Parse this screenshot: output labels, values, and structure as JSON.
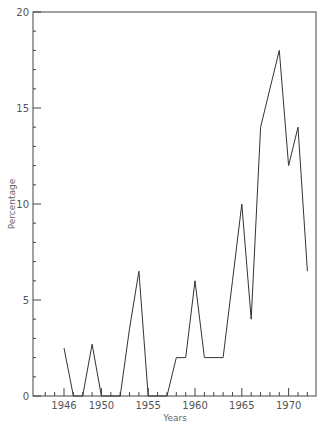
{
  "chart_data": {
    "type": "line",
    "title": "",
    "xlabel": "Years",
    "ylabel": "Percentage",
    "xlim": [
      1943.3,
      1973.5
    ],
    "ylim": [
      0,
      20
    ],
    "grid": false,
    "legend": null,
    "x_ticks": [
      1946,
      1950,
      1955,
      1960,
      1965,
      1970
    ],
    "y_ticks": [
      0,
      5,
      10,
      15,
      20
    ],
    "series": [
      {
        "name": "Percentage",
        "x": [
          1946,
          1947,
          1948,
          1949,
          1950,
          1951,
          1952,
          1953,
          1954,
          1955,
          1956,
          1957,
          1958,
          1959,
          1960,
          1961,
          1962,
          1963,
          1964,
          1965,
          1966,
          1967,
          1968,
          1969,
          1970,
          1971,
          1972
        ],
        "values": [
          2.5,
          0,
          0,
          2.7,
          0,
          0,
          0,
          3.5,
          6.5,
          0,
          0,
          0,
          2,
          2,
          6,
          2,
          2,
          2,
          6,
          10,
          4,
          14,
          16,
          18,
          12,
          14,
          6.5
        ]
      }
    ],
    "color": "#333333"
  }
}
